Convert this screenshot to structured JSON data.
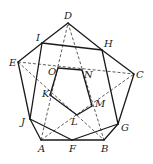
{
  "diagram": {
    "title": "",
    "points": {
      "D": {
        "x": 68,
        "y": 23,
        "label": "D",
        "lx": 64,
        "ly": 19
      },
      "I": {
        "x": 42,
        "y": 43,
        "label": "I",
        "lx": 36,
        "ly": 41
      },
      "H": {
        "x": 102,
        "y": 50,
        "label": "H",
        "lx": 104,
        "ly": 47
      },
      "E": {
        "x": 18,
        "y": 62,
        "label": "E",
        "lx": 9,
        "ly": 66
      },
      "C": {
        "x": 134,
        "y": 74,
        "label": "C",
        "lx": 136,
        "ly": 78
      },
      "O": {
        "x": 58,
        "y": 68,
        "label": "O",
        "lx": 48,
        "ly": 75
      },
      "N": {
        "x": 82,
        "y": 70,
        "label": "N",
        "lx": 84,
        "ly": 78
      },
      "K": {
        "x": 50,
        "y": 95,
        "label": "K",
        "lx": 42,
        "ly": 97
      },
      "M": {
        "x": 92,
        "y": 106,
        "label": "M",
        "lx": 95,
        "ly": 107
      },
      "J": {
        "x": 30,
        "y": 119,
        "label": "J",
        "lx": 21,
        "ly": 125
      },
      "G": {
        "x": 118,
        "y": 124,
        "label": "G",
        "lx": 121,
        "ly": 131
      },
      "L": {
        "x": 77,
        "y": 115,
        "label": "L",
        "lx": 71,
        "ly": 125
      },
      "A": {
        "x": 41,
        "y": 140,
        "label": "A",
        "lx": 38,
        "ly": 152
      },
      "F": {
        "x": 72,
        "y": 140,
        "label": "F",
        "lx": 69,
        "ly": 152
      },
      "B": {
        "x": 104,
        "y": 140,
        "label": "B",
        "lx": 101,
        "ly": 152
      }
    },
    "solid_segments": [
      [
        "D",
        "I"
      ],
      [
        "I",
        "E"
      ],
      [
        "E",
        "J"
      ],
      [
        "J",
        "A"
      ],
      [
        "A",
        "B"
      ],
      [
        "B",
        "G"
      ],
      [
        "G",
        "C"
      ],
      [
        "C",
        "H"
      ],
      [
        "H",
        "D"
      ],
      [
        "I",
        "H"
      ],
      [
        "I",
        "J"
      ],
      [
        "H",
        "G"
      ],
      [
        "O",
        "N"
      ],
      [
        "O",
        "K"
      ],
      [
        "N",
        "M"
      ],
      [
        "K",
        "L"
      ],
      [
        "M",
        "L"
      ],
      [
        "J",
        "F"
      ],
      [
        "F",
        "G"
      ]
    ],
    "dashed_segments": [
      [
        "E",
        "C"
      ],
      [
        "E",
        "B"
      ],
      [
        "A",
        "C"
      ],
      [
        "A",
        "D"
      ],
      [
        "D",
        "B"
      ]
    ]
  }
}
